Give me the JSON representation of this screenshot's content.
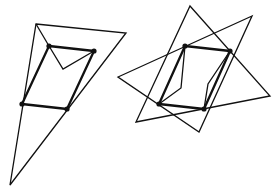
{
  "diagram": {
    "type": "geometric-line-drawing",
    "stroke_color": "#111111",
    "background": "#ffffff",
    "figures": [
      {
        "name": "left-figure",
        "parallelogram": [
          [
            49,
            46
          ],
          [
            94,
            51
          ],
          [
            67,
            109
          ],
          [
            22,
            104
          ]
        ],
        "outer_triangles": [
          [
            [
              36,
              24
            ],
            [
              126,
              33
            ],
            [
              10,
              185
            ]
          ]
        ],
        "extra_polylines": [
          [
            [
              36,
              24
            ],
            [
              49,
              46
            ]
          ],
          [
            [
              49,
              46
            ],
            [
              63,
              69
            ],
            [
              94,
              51
            ]
          ]
        ]
      },
      {
        "name": "right-figure",
        "parallelogram": [
          [
            185,
            46
          ],
          [
            230,
            51
          ],
          [
            204,
            109
          ],
          [
            159,
            104
          ]
        ],
        "outer_triangles": [
          [
            [
              190,
              6
            ],
            [
              270,
              96
            ],
            [
              136,
              122
            ]
          ],
          [
            [
              252,
              16
            ],
            [
              118,
              77
            ],
            [
              199,
              132
            ]
          ]
        ],
        "extra_polylines": [
          [
            [
              185,
              46
            ],
            [
              181,
              88
            ],
            [
              159,
              104
            ]
          ],
          [
            [
              230,
              51
            ],
            [
              208,
              84
            ],
            [
              204,
              109
            ]
          ]
        ]
      }
    ]
  }
}
